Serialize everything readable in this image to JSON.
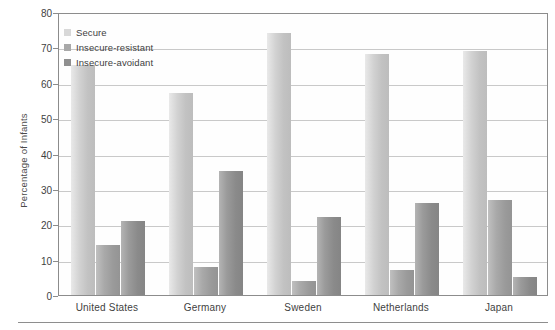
{
  "chart_data": {
    "type": "bar",
    "title": "",
    "xlabel": "",
    "ylabel": "Percentage of Infants",
    "ylim": [
      0,
      80
    ],
    "yticks": [
      0,
      10,
      20,
      30,
      40,
      50,
      60,
      70,
      80
    ],
    "grid": true,
    "legend_position": "top-left",
    "categories": [
      "United States",
      "Germany",
      "Sweden",
      "Netherlands",
      "Japan"
    ],
    "series": [
      {
        "name": "Secure",
        "color": "#d2d2d2",
        "values": [
          65,
          57,
          74,
          68,
          69
        ]
      },
      {
        "name": "Insecure-resistant",
        "color": "#a4a4a4",
        "values": [
          14,
          8,
          4,
          7,
          27
        ]
      },
      {
        "name": "Insecure-avoidant",
        "color": "#909090",
        "values": [
          21,
          35,
          22,
          26,
          5
        ]
      }
    ]
  },
  "axis": {
    "y_title": "Percentage of Infants",
    "y_tick_labels": [
      "80",
      "70",
      "60",
      "50",
      "40",
      "30",
      "20",
      "10",
      "0"
    ]
  },
  "legend": {
    "items": [
      {
        "label": "Secure"
      },
      {
        "label": "Insecure-resistant"
      },
      {
        "label": "Insecure-avoidant"
      }
    ]
  },
  "x_axis": {
    "labels": [
      "United States",
      "Germany",
      "Sweden",
      "Netherlands",
      "Japan"
    ]
  }
}
